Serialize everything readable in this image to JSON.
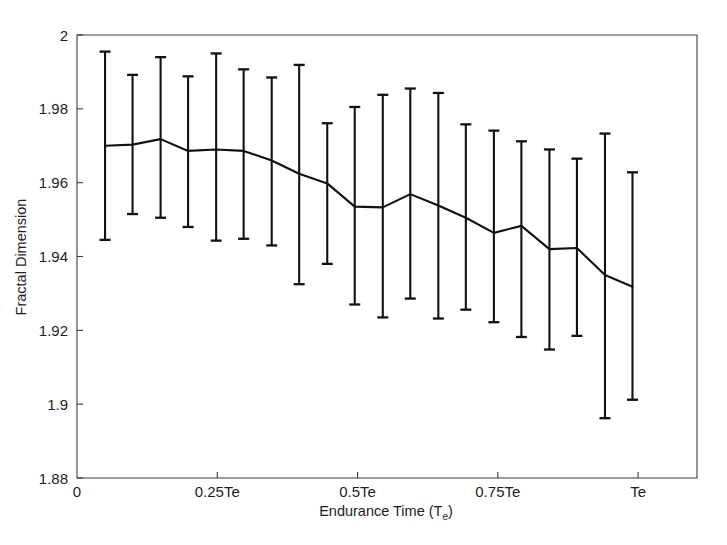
{
  "figure": {
    "title": "",
    "background_color": "#ffffff",
    "line_color": "#111111",
    "axis_color": "#3c3c3c"
  },
  "axes": {
    "y_label": "Fractal Dimension",
    "x_label_main": "Endurance Time (T",
    "x_label_sub": "e",
    "x_label_close": ")",
    "y_ticks": [
      "1.88",
      "1.9",
      "1.92",
      "1.94",
      "1.96",
      "1.98",
      "2"
    ],
    "y_tick_values": [
      1.88,
      1.9,
      1.92,
      1.94,
      1.96,
      1.98,
      2.0
    ],
    "x_ticks": [
      "0",
      "0.25Te",
      "0.5Te",
      "0.75Te",
      "Te"
    ],
    "x_tick_values": [
      0,
      0.25,
      0.5,
      0.75,
      1.0
    ]
  },
  "chart_data": {
    "type": "line",
    "title": "",
    "xlabel": "Endurance Time (Te)",
    "ylabel": "Fractal Dimension",
    "xlim": [
      0,
      1.105
    ],
    "ylim": [
      1.88,
      2.0
    ],
    "grid": false,
    "legend": "none",
    "error_bars": true,
    "x_tick_labels": [
      "0",
      "0.25Te",
      "0.5Te",
      "0.75Te",
      "Te"
    ],
    "x_tick_positions": [
      0,
      0.25,
      0.5,
      0.75,
      1.0
    ],
    "y_tick_labels": [
      "1.88",
      "1.9",
      "1.92",
      "1.94",
      "1.96",
      "1.98",
      "2"
    ],
    "y_tick_positions": [
      1.88,
      1.9,
      1.92,
      1.94,
      1.96,
      1.98,
      2.0
    ],
    "series": [
      {
        "name": "Fractal Dimension",
        "x": [
          0.05,
          0.099,
          0.149,
          0.198,
          0.248,
          0.297,
          0.347,
          0.396,
          0.446,
          0.495,
          0.545,
          0.594,
          0.644,
          0.693,
          0.743,
          0.792,
          0.842,
          0.891,
          0.941,
          0.99
        ],
        "y": [
          1.97,
          1.9703,
          1.9718,
          1.9686,
          1.969,
          1.9686,
          1.966,
          1.9624,
          1.9598,
          1.9535,
          1.9533,
          1.9569,
          1.9538,
          1.9505,
          1.9464,
          1.9483,
          1.942,
          1.9423,
          1.935,
          1.9318
        ],
        "y_err_upper": [
          1.9955,
          1.9892,
          1.994,
          1.9888,
          1.995,
          1.9907,
          1.9885,
          1.9919,
          1.9761,
          1.9805,
          1.9838,
          1.9855,
          1.9843,
          1.9758,
          1.9741,
          1.9712,
          1.969,
          1.9665,
          1.9733,
          1.9628
        ],
        "y_err_lower": [
          1.9445,
          1.9515,
          1.9505,
          1.948,
          1.9443,
          1.9448,
          1.943,
          1.9325,
          1.938,
          1.927,
          1.9235,
          1.9286,
          1.9232,
          1.9256,
          1.9222,
          1.9182,
          1.9148,
          1.9185,
          1.8962,
          1.9012
        ]
      }
    ]
  }
}
